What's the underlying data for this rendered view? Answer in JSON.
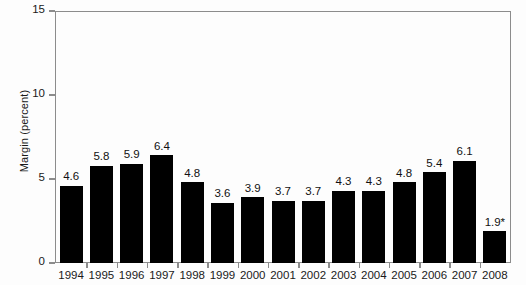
{
  "chart_data": {
    "type": "bar",
    "title": "",
    "xlabel": "",
    "ylabel": "Margin (percent)",
    "ylim": [
      0,
      15
    ],
    "yticks": [
      "0",
      "5",
      "10",
      "15"
    ],
    "ytick_values": [
      0,
      5,
      10,
      15
    ],
    "grid": false,
    "legend": "none",
    "bar_color": "#000000",
    "axis_color": "#8c8c8c",
    "background_color": "#fdfdfd",
    "categories": [
      "1994",
      "1995",
      "1996",
      "1997",
      "1998",
      "1999",
      "2000",
      "2001",
      "2002",
      "2003",
      "2004",
      "2005",
      "2006",
      "2007",
      "2008"
    ],
    "values": [
      4.6,
      5.8,
      5.9,
      6.4,
      4.8,
      3.6,
      3.9,
      3.7,
      3.7,
      4.3,
      4.3,
      4.8,
      5.4,
      6.1,
      1.9
    ],
    "value_labels": [
      "4.6",
      "5.8",
      "5.9",
      "6.4",
      "4.8",
      "3.6",
      "3.9",
      "3.7",
      "3.7",
      "4.3",
      "4.3",
      "4.8",
      "5.4",
      "6.1",
      "1.9*"
    ],
    "annotations": [
      {
        "category": "2008",
        "label": "1.9*",
        "note": "asterisk marks the 2008 value"
      }
    ]
  }
}
